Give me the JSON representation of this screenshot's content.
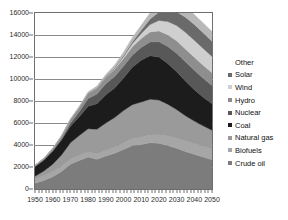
{
  "chart_data": {
    "type": "area",
    "stacked": true,
    "title": "",
    "subtitle": "",
    "xlabel": "",
    "ylabel": "",
    "xlim": [
      1950,
      2050
    ],
    "ylim": [
      0,
      16000
    ],
    "grid": true,
    "legend_position": "right",
    "x_ticks": [
      "1950",
      "1960",
      "1970",
      "1980",
      "1990",
      "2000",
      "2010",
      "2020",
      "2030",
      "2040",
      "2050"
    ],
    "y_ticks": [
      "0",
      "2000",
      "4000",
      "6000",
      "8000",
      "10000",
      "12000",
      "14000",
      "16000"
    ],
    "x": [
      1950,
      1955,
      1960,
      1965,
      1970,
      1975,
      1980,
      1985,
      1990,
      1995,
      2000,
      2005,
      2010,
      2015,
      2020,
      2025,
      2030,
      2035,
      2040,
      2045,
      2050
    ],
    "series": [
      {
        "name": "Crude oil",
        "color": "#7c7c7c",
        "values": [
          520,
          780,
          1120,
          1600,
          2250,
          2600,
          2900,
          2700,
          3000,
          3250,
          3600,
          3950,
          4050,
          4200,
          4150,
          3950,
          3700,
          3400,
          3150,
          2900,
          2650
        ]
      },
      {
        "name": "Biofuels",
        "color": "#a6a6a6",
        "values": [
          420,
          430,
          440,
          450,
          460,
          470,
          480,
          490,
          510,
          540,
          580,
          620,
          660,
          720,
          790,
          860,
          920,
          960,
          980,
          990,
          1000
        ]
      },
      {
        "name": "Natural gas",
        "color": "#9a9a9a",
        "values": [
          230,
          420,
          700,
          1050,
          1500,
          1800,
          2100,
          2250,
          2500,
          2700,
          2950,
          3100,
          3200,
          3250,
          3150,
          2900,
          2600,
          2300,
          2050,
          1850,
          1700
        ]
      },
      {
        "name": "Coal",
        "color": "#1c1c1c",
        "values": [
          880,
          1000,
          1180,
          1350,
          1500,
          1700,
          2050,
          2300,
          2550,
          2700,
          2950,
          3400,
          3800,
          3950,
          3900,
          3700,
          3450,
          3150,
          2850,
          2600,
          2400
        ]
      },
      {
        "name": "Nuclear",
        "color": "#585858",
        "values": [
          0,
          10,
          40,
          110,
          260,
          450,
          700,
          900,
          1000,
          1040,
          1080,
          1100,
          1150,
          1250,
          1400,
          1550,
          1680,
          1750,
          1760,
          1720,
          1650
        ]
      },
      {
        "name": "Hydro",
        "color": "#8e8e8e",
        "values": [
          90,
          130,
          190,
          250,
          330,
          400,
          470,
          530,
          600,
          650,
          700,
          760,
          820,
          900,
          980,
          1060,
          1120,
          1160,
          1180,
          1180,
          1170
        ]
      },
      {
        "name": "Wind",
        "color": "#cfcfcf",
        "values": [
          0,
          0,
          0,
          0,
          0,
          0,
          5,
          15,
          40,
          90,
          170,
          290,
          450,
          680,
          950,
          1200,
          1400,
          1520,
          1560,
          1540,
          1480
        ]
      },
      {
        "name": "Solar",
        "color": "#6a6a6a",
        "values": [
          0,
          0,
          0,
          0,
          0,
          0,
          2,
          8,
          20,
          45,
          90,
          170,
          300,
          500,
          760,
          1020,
          1240,
          1380,
          1430,
          1420,
          1380
        ]
      },
      {
        "name": "Other",
        "color": "#b8b8b8",
        "values": [
          20,
          30,
          45,
          60,
          80,
          100,
          130,
          160,
          200,
          250,
          310,
          380,
          460,
          560,
          660,
          760,
          840,
          890,
          910,
          900,
          880
        ]
      }
    ],
    "totals": [
      2160,
      2800,
      3715,
      4870,
      6380,
      7520,
      8837,
      9353,
      10420,
      11265,
      12430,
      13770,
      14890,
      15910,
      16740,
      17000,
      16950,
      16510,
      15870,
      15100,
      14310
    ]
  },
  "legend": {
    "entries": [
      {
        "label": "Other",
        "color": "#b8b8b8",
        "marker": false
      },
      {
        "label": "Solar",
        "color": "#6a6a6a",
        "marker": true
      },
      {
        "label": "Wind",
        "color": "#cfcfcf",
        "marker": true
      },
      {
        "label": "Hydro",
        "color": "#8e8e8e",
        "marker": true
      },
      {
        "label": "Nuclear",
        "color": "#585858",
        "marker": true
      },
      {
        "label": "Coal",
        "color": "#1c1c1c",
        "marker": true
      },
      {
        "label": "Natural gas",
        "color": "#9a9a9a",
        "marker": true
      },
      {
        "label": "Biofuels",
        "color": "#a6a6a6",
        "marker": true
      },
      {
        "label": "Crude oil",
        "color": "#7c7c7c",
        "marker": true
      }
    ]
  },
  "style": {
    "axis_color": "#6e6e6e",
    "grid_color": "#8a8a8a",
    "text_color": "#1a1a1a",
    "plot_background": "#ffffff"
  }
}
